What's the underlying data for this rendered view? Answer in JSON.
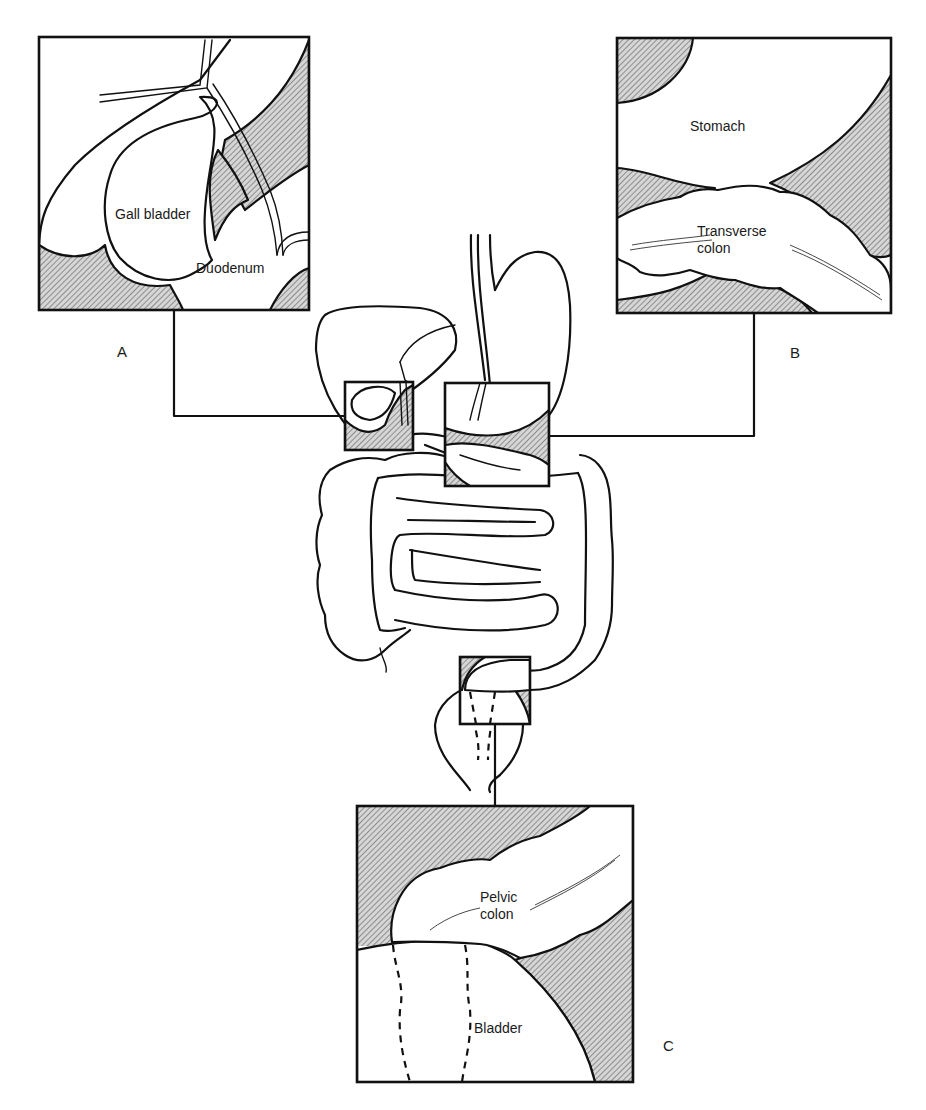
{
  "figure": {
    "colors": {
      "ink": "#111111",
      "hatch_fill": "#bdbdbd",
      "background": "#ffffff"
    }
  },
  "panels": [
    {
      "id": "A",
      "letter": "A",
      "labels": [
        "Gall bladder",
        "Duodenum"
      ]
    },
    {
      "id": "B",
      "letter": "B",
      "labels": [
        "Stomach",
        "Transverse",
        "colon"
      ]
    },
    {
      "id": "C",
      "letter": "C",
      "labels": [
        "Pelvic",
        "colon",
        "Bladder"
      ]
    }
  ]
}
